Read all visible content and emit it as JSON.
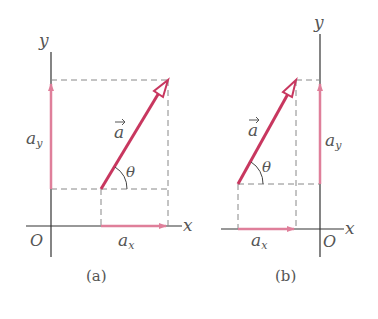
{
  "colors": {
    "vector": "#c8375f",
    "component": "#df7f9a",
    "axis": "#333333",
    "dashed": "#888888",
    "text": "#555555"
  },
  "panels": [
    {
      "caption": "(a)",
      "x_label": "x",
      "y_label": "y",
      "origin_label": "O",
      "vector_label": "a",
      "ax_label": "a",
      "ax_sub": "x",
      "ay_label": "a",
      "ay_sub": "y",
      "angle_label": "θ"
    },
    {
      "caption": "(b)",
      "x_label": "x",
      "y_label": "y",
      "origin_label": "O",
      "vector_label": "a",
      "ax_label": "a",
      "ax_sub": "x",
      "ay_label": "a",
      "ay_sub": "y",
      "angle_label": "θ"
    }
  ]
}
